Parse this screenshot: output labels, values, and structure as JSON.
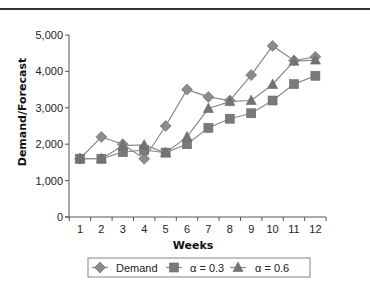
{
  "chart_data": {
    "type": "line",
    "title": "",
    "xlabel": "Weeks",
    "ylabel": "Demand/Forecast",
    "x": [
      1,
      2,
      3,
      4,
      5,
      6,
      7,
      8,
      9,
      10,
      11,
      12
    ],
    "categories": [
      "1",
      "2",
      "3",
      "4",
      "5",
      "6",
      "7",
      "8",
      "9",
      "10",
      "11",
      "12"
    ],
    "ylim": [
      0,
      5000
    ],
    "yticks": [
      0,
      1000,
      2000,
      3000,
      4000,
      5000
    ],
    "ytick_labels": [
      "0",
      "1,000",
      "2,000",
      "3,000",
      "4,000",
      "5,000"
    ],
    "grid": false,
    "legend_position": "bottom",
    "series": [
      {
        "name": "Demand",
        "marker": "diamond",
        "color": "#8c8c8c",
        "values": [
          1600,
          2200,
          2000,
          1600,
          2500,
          3500,
          3300,
          3200,
          3900,
          4700,
          4300,
          4400
        ]
      },
      {
        "name": "α = 0.3",
        "marker": "square",
        "color": "#7a7a7a",
        "values": [
          1600,
          1600,
          1780,
          1840,
          1770,
          2000,
          2450,
          2700,
          2850,
          3200,
          3650,
          3880
        ]
      },
      {
        "name": "α = 0.6",
        "marker": "triangle",
        "color": "#737373",
        "values": [
          1600,
          1600,
          1960,
          1980,
          1760,
          2200,
          2980,
          3170,
          3200,
          3640,
          4280,
          4310
        ]
      }
    ]
  }
}
